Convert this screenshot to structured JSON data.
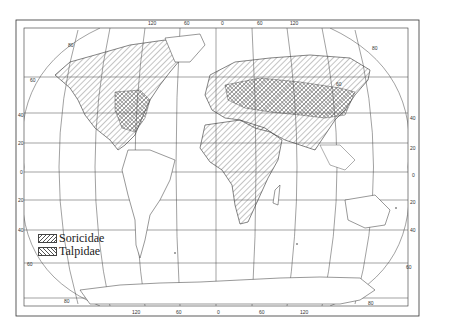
{
  "map": {
    "title": "",
    "projection": "elliptical world map with graticule",
    "legend": [
      {
        "label": "Soricidae",
        "pattern": "diagonal-hatch"
      },
      {
        "label": "Talpidae",
        "pattern": "cross-hatch"
      }
    ],
    "top_longitude_labels": [
      "120",
      "60",
      "0",
      "60",
      "120"
    ],
    "bottom_longitude_labels": [
      "120",
      "60",
      "0",
      "60",
      "120"
    ],
    "left_latitude_labels": [
      "60",
      "40",
      "20",
      "0",
      "20",
      "40",
      "60"
    ],
    "right_latitude_labels": [
      "60",
      "40",
      "20",
      "0",
      "20",
      "40",
      "60"
    ],
    "corner_labels": {
      "nw": "80",
      "ne": "80",
      "sw": "80",
      "se": "80"
    },
    "colors": {
      "line": "#333333",
      "hatch": "#555555",
      "background": "#ffffff"
    }
  }
}
